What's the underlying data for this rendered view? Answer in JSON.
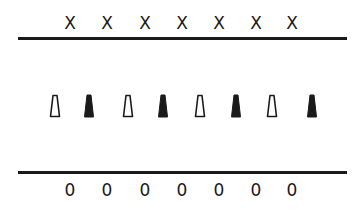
{
  "diagram": {
    "top_row": {
      "symbol": "X",
      "labels": [
        "X",
        "X",
        "X",
        "X",
        "X",
        "X",
        "X"
      ],
      "x_positions": [
        70,
        107,
        145,
        182,
        219,
        256,
        292
      ]
    },
    "middle_row": {
      "shape": "tapered-trapezoid",
      "items": [
        {
          "fill": "outline",
          "x": 55
        },
        {
          "fill": "solid",
          "x": 89
        },
        {
          "fill": "outline",
          "x": 128
        },
        {
          "fill": "solid",
          "x": 163
        },
        {
          "fill": "outline",
          "x": 200
        },
        {
          "fill": "solid",
          "x": 236
        },
        {
          "fill": "outline",
          "x": 272
        },
        {
          "fill": "solid",
          "x": 312
        }
      ]
    },
    "bottom_row": {
      "symbol": "0",
      "labels": [
        "0",
        "0",
        "0",
        "0",
        "0",
        "0",
        "0"
      ],
      "x_positions": [
        70,
        107,
        145,
        182,
        219,
        256,
        292
      ]
    },
    "lines": {
      "top_y": 38,
      "bottom_y": 172
    },
    "colors": {
      "ink": "#1a1a1a",
      "background": "#ffffff"
    }
  }
}
